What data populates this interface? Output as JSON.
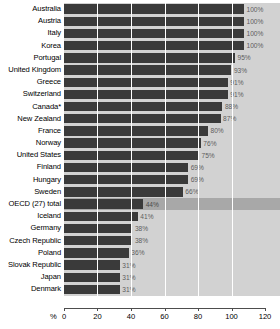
{
  "chart_data": {
    "type": "bar",
    "orientation": "horizontal",
    "title": "",
    "xlabel": "%",
    "ylabel": "",
    "xlim": [
      0,
      120
    ],
    "xticks": [
      0,
      20,
      40,
      60,
      80,
      100,
      120
    ],
    "grid": true,
    "legend": null,
    "value_label_suffix": "%",
    "highlight_category": "OECD (27) total",
    "colors": {
      "bar": "#3a3a3a",
      "plot_background": "#d2d2d2",
      "highlight_background": "#a8a8a8",
      "gridline": "#ffffff",
      "axis": "#4d4d4d",
      "label_text": "#000000",
      "value_text": "#5d5d5d"
    },
    "categories": [
      "Australia",
      "Austria",
      "Italy",
      "Korea",
      "Portugal",
      "United Kingdom",
      "Greece",
      "Switzerland",
      "Canada*",
      "New Zealand",
      "France",
      "Norway",
      "United States",
      "Finland",
      "Hungary",
      "Sweden",
      "OECD (27) total",
      "Iceland",
      "Germany",
      "Czech Republic",
      "Poland",
      "Slovak Republic",
      "Japan",
      "Denmark"
    ],
    "values": [
      100,
      100,
      100,
      100,
      95,
      93,
      91,
      91,
      88,
      87,
      80,
      76,
      75,
      69,
      69,
      66,
      44,
      41,
      38,
      38,
      36,
      31,
      31,
      31
    ],
    "value_labels": [
      "100%",
      "100%",
      "100%",
      "100%",
      "95%",
      "93%",
      "91%",
      "91%",
      "88%",
      "87%",
      "80%",
      "76%",
      "75%",
      "69%",
      "69%",
      "66%",
      "44%",
      "41%",
      "38%",
      "38%",
      "36%",
      "31%",
      "31%",
      "31%"
    ],
    "xtick_labels": [
      "0",
      "20",
      "40",
      "60",
      "80",
      "100",
      "120"
    ]
  }
}
